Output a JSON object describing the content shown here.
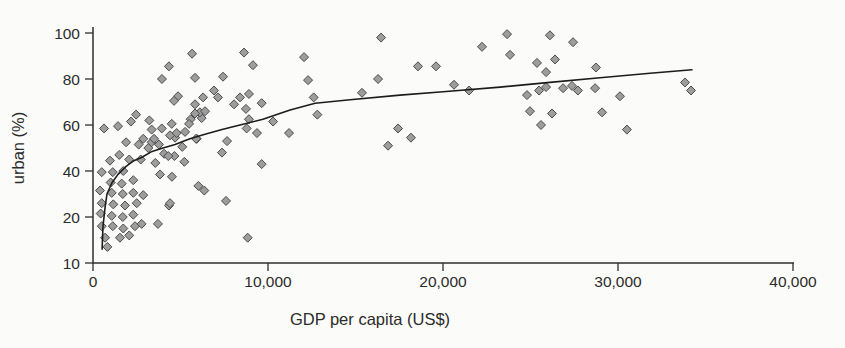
{
  "figure": {
    "background": "#fbfbf9",
    "text_color": "#2b2b2b",
    "axis_color": "#2f2f2f"
  },
  "chart_data": {
    "type": "scatter",
    "title": "",
    "xlabel": "GDP per capita (US$)",
    "ylabel": "urban (%)",
    "xlim": [
      0,
      40000
    ],
    "grid": false,
    "legend": "none",
    "x_ticks": {
      "values": [
        0,
        10000,
        20000,
        30000,
        40000
      ],
      "labels": [
        "0",
        "10,000",
        "20,000",
        "30,000",
        "40,000"
      ]
    },
    "y_ticks": {
      "values": [
        10,
        20,
        40,
        60,
        80,
        100
      ],
      "labels": [
        "10",
        "20",
        "40",
        "60",
        "80",
        "100"
      ],
      "note": "tick marks equally spaced on axis - non-linear scale"
    },
    "marker": {
      "shape": "diamond",
      "fill": "#9d9d9d",
      "stroke": "#4b4b4b",
      "size": 9
    },
    "trend_curve": {
      "color": "#1c1c1c",
      "width": 1.6,
      "points": [
        [
          520,
          13
        ],
        [
          570,
          18
        ],
        [
          690,
          24.3
        ],
        [
          800,
          30
        ],
        [
          1090,
          35
        ],
        [
          1430,
          38.5
        ],
        [
          1890,
          42
        ],
        [
          2340,
          44.5
        ],
        [
          2800,
          46
        ],
        [
          3370,
          48.5
        ],
        [
          4000,
          50
        ],
        [
          4690,
          51.5
        ],
        [
          5540,
          54
        ],
        [
          6400,
          56
        ],
        [
          7370,
          58
        ],
        [
          8400,
          60
        ],
        [
          9710,
          62.5
        ],
        [
          11260,
          66.5
        ],
        [
          12690,
          69.5
        ],
        [
          14690,
          71
        ],
        [
          17540,
          73
        ],
        [
          20000,
          74.5
        ],
        [
          23260,
          76.5
        ],
        [
          26110,
          78.5
        ],
        [
          28970,
          80.5
        ],
        [
          31830,
          82.5
        ],
        [
          34230,
          84
        ]
      ]
    },
    "points": [
      [
        1890,
        52.5
      ],
      [
        2610,
        51.5
      ],
      [
        3350,
        52.5
      ],
      [
        3770,
        51.5
      ],
      [
        4060,
        47.5
      ],
      [
        4650,
        46.5
      ],
      [
        970,
        44.5
      ],
      [
        1500,
        47
      ],
      [
        2070,
        45
      ],
      [
        2730,
        45
      ],
      [
        3560,
        43.5
      ],
      [
        500,
        39.5
      ],
      [
        1130,
        39.5
      ],
      [
        1730,
        40
      ],
      [
        1010,
        35
      ],
      [
        1640,
        34.5
      ],
      [
        2300,
        36
      ],
      [
        400,
        31.5
      ],
      [
        1070,
        30.5
      ],
      [
        1700,
        30
      ],
      [
        2300,
        30.5
      ],
      [
        2870,
        29.5
      ],
      [
        500,
        26
      ],
      [
        1160,
        25.5
      ],
      [
        1830,
        25
      ],
      [
        2500,
        26
      ],
      [
        4340,
        25
      ],
      [
        440,
        21.5
      ],
      [
        1070,
        20.5
      ],
      [
        1700,
        20
      ],
      [
        2300,
        21
      ],
      [
        3710,
        18.5
      ],
      [
        500,
        18
      ],
      [
        1130,
        18
      ],
      [
        1730,
        17.5
      ],
      [
        2400,
        18
      ],
      [
        2780,
        18.5
      ],
      [
        690,
        15.5
      ],
      [
        1540,
        15.5
      ],
      [
        2070,
        16
      ],
      [
        820,
        13.5
      ],
      [
        3830,
        38.5
      ],
      [
        4510,
        37.5
      ],
      [
        4400,
        26
      ],
      [
        7600,
        27
      ],
      [
        8840,
        15.5
      ],
      [
        6020,
        33.5
      ],
      [
        6360,
        31.5
      ],
      [
        4690,
        54.5
      ],
      [
        5930,
        54
      ],
      [
        7660,
        53
      ],
      [
        5100,
        50.5
      ],
      [
        4300,
        46.5
      ],
      [
        7370,
        48
      ],
      [
        5220,
        44
      ],
      [
        9640,
        43
      ],
      [
        3220,
        62
      ],
      [
        4500,
        60.5
      ],
      [
        5580,
        62.5
      ],
      [
        6210,
        63
      ],
      [
        3350,
        58
      ],
      [
        3930,
        58.5
      ],
      [
        4400,
        55.5
      ],
      [
        4780,
        56.5
      ],
      [
        5260,
        57
      ],
      [
        2870,
        54
      ],
      [
        3490,
        54
      ],
      [
        3160,
        50
      ],
      [
        5890,
        54
      ],
      [
        8780,
        58.5
      ],
      [
        9370,
        56.5
      ],
      [
        11200,
        56.5
      ],
      [
        630,
        58.5
      ],
      [
        1430,
        59.5
      ],
      [
        2460,
        64.5
      ],
      [
        2170,
        61.5
      ],
      [
        8060,
        69
      ],
      [
        8400,
        72
      ],
      [
        8910,
        73.5
      ],
      [
        8740,
        67
      ],
      [
        9640,
        69.5
      ],
      [
        8910,
        62.5
      ],
      [
        10290,
        61.5
      ],
      [
        12610,
        72
      ],
      [
        12820,
        64.5
      ],
      [
        4860,
        72.5
      ],
      [
        4630,
        70.5
      ],
      [
        6910,
        75
      ],
      [
        7140,
        72
      ],
      [
        6290,
        72
      ],
      [
        5830,
        69
      ],
      [
        6110,
        65.5
      ],
      [
        5830,
        65
      ],
      [
        6400,
        66
      ],
      [
        5490,
        60.5
      ],
      [
        5660,
        91
      ],
      [
        8630,
        91.5
      ],
      [
        4340,
        85.5
      ],
      [
        9140,
        86
      ],
      [
        3940,
        80
      ],
      [
        5830,
        80.5
      ],
      [
        7430,
        81
      ],
      [
        12060,
        89.5
      ],
      [
        12290,
        79.5
      ],
      [
        16460,
        98
      ],
      [
        18570,
        85.5
      ],
      [
        19600,
        85.5
      ],
      [
        16290,
        80
      ],
      [
        23660,
        99.5
      ],
      [
        26110,
        99
      ],
      [
        27430,
        96
      ],
      [
        22230,
        94
      ],
      [
        23830,
        90.5
      ],
      [
        25370,
        87
      ],
      [
        26400,
        88.5
      ],
      [
        25890,
        83
      ],
      [
        28740,
        85
      ],
      [
        15370,
        74
      ],
      [
        20630,
        77.5
      ],
      [
        21490,
        75
      ],
      [
        24800,
        73
      ],
      [
        25490,
        75
      ],
      [
        25890,
        76.5
      ],
      [
        26860,
        76
      ],
      [
        27370,
        77
      ],
      [
        27710,
        75
      ],
      [
        28690,
        76
      ],
      [
        30110,
        72.5
      ],
      [
        24970,
        66
      ],
      [
        26230,
        65
      ],
      [
        29090,
        65.5
      ],
      [
        25600,
        60
      ],
      [
        30510,
        58
      ],
      [
        16860,
        51
      ],
      [
        17430,
        58.5
      ],
      [
        18170,
        54.5
      ],
      [
        33830,
        78.5
      ],
      [
        34170,
        75
      ]
    ]
  }
}
